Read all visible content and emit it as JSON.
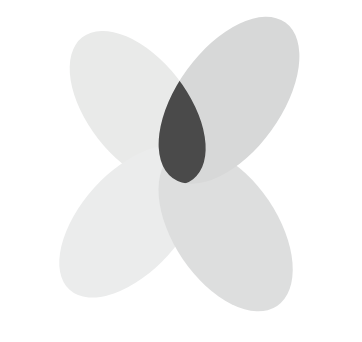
{
  "figure": {
    "title": "Four Petal Rosette",
    "kind": "abstract-vector-shape",
    "canvas": {
      "width": 362,
      "height": 342,
      "background_color": "#ffffff"
    },
    "palette": {
      "background": "#ffffff",
      "petal_light": "#e9eae9",
      "petal_light_alt": "#ebecec",
      "petal_medium": "#d7d8d8",
      "petal_medium_alt": "#dddede",
      "overlap_dark": "#4a4a4a"
    },
    "center": {
      "x": 182,
      "y": 165
    },
    "petal_count": 4,
    "petals": [
      {
        "id": "petal-upper-left",
        "label": "Upper Left Petal",
        "color": "#e9eae9",
        "rotation_deg": -38,
        "tip": {
          "x": 40,
          "y": 95
        },
        "length": 165,
        "width": 95
      },
      {
        "id": "petal-upper-right",
        "label": "Upper Right Petal",
        "color": "#d7d8d8",
        "rotation_deg": 36,
        "tip": {
          "x": 305,
          "y": 30
        },
        "length": 185,
        "width": 100
      },
      {
        "id": "petal-lower-left",
        "label": "Lower Left Petal",
        "color": "#ebecec",
        "rotation_deg": 42,
        "tip": {
          "x": 78,
          "y": 305
        },
        "length": 175,
        "width": 95
      },
      {
        "id": "petal-lower-right",
        "label": "Lower Right Petal",
        "color": "#dddede",
        "rotation_deg": -34,
        "tip": {
          "x": 330,
          "y": 245
        },
        "length": 175,
        "width": 100
      }
    ],
    "overlap_region": {
      "id": "overlap-diamond",
      "label": "Central Overlap Diamond",
      "color": "#4a4a4a",
      "shape": "rounded-diamond",
      "bounds": {
        "x": 147,
        "y": 114,
        "width": 73,
        "height": 100
      }
    },
    "gaps": [
      {
        "id": "gap-top",
        "label": "Top White Gap",
        "color": "#ffffff"
      },
      {
        "id": "gap-bottom",
        "label": "Bottom White Gap",
        "color": "#ffffff"
      },
      {
        "id": "notch-left",
        "label": "Left White Notch",
        "color": "#ffffff"
      },
      {
        "id": "notch-right",
        "label": "Right White Notch",
        "color": "#ffffff"
      }
    ]
  }
}
